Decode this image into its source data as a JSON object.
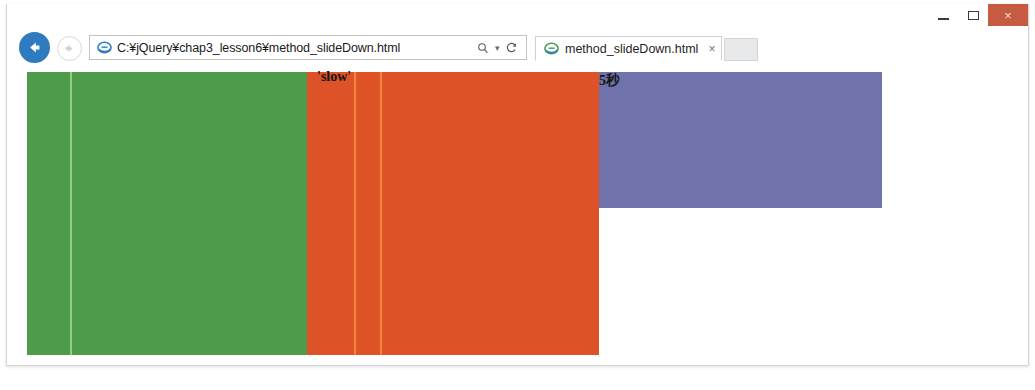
{
  "window": {
    "controls": {
      "minimize_label": "Minimize",
      "maximize_label": "Maximize",
      "close_label": "×"
    },
    "close_button_color": "#c75b42"
  },
  "navigation": {
    "back_label": "Back",
    "forward_label": "Forward",
    "search_icon": "search-icon",
    "caret_glyph": "▾",
    "refresh_glyph": "↻"
  },
  "address": {
    "value": "C:¥jQuery¥chap3_lesson6¥method_slideDown.html",
    "placeholder": "",
    "site_icon": "internet-explorer-icon"
  },
  "tabs": [
    {
      "title": "method_slideDown.html",
      "favicon": "internet-explorer-icon",
      "close_glyph": "×",
      "active": true
    }
  ],
  "new_tab": {
    "label": ""
  },
  "toolbar": {
    "home_label": "Home",
    "favorites_label": "Favorites",
    "settings_label": "Tools"
  },
  "page": {
    "blocks": [
      {
        "name": "green-panel",
        "color": "#4e9b4a",
        "divider_color": "#8ed07f",
        "label": ""
      },
      {
        "name": "orange-panel",
        "color": "#dd5327",
        "divider_color": "#f2863e",
        "label": "'slow'"
      },
      {
        "name": "purple-panel",
        "color": "#6f72ab",
        "label": "5秒"
      }
    ],
    "labels": {
      "slow": "'slow'",
      "seconds": "5秒"
    }
  }
}
